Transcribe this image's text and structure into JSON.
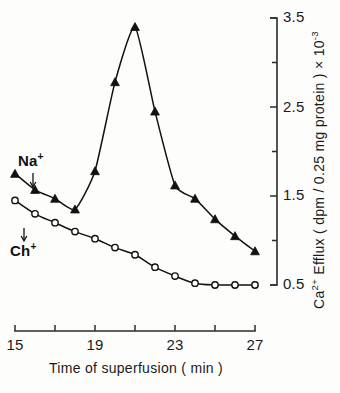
{
  "chart_data": {
    "type": "line",
    "title": "",
    "xlabel": "Time of superfusion  ( min )",
    "ylabel": "Ca2+  Efflux  ( dpm / 0.25 mg protein ) x 10-3",
    "ylabel_parts": {
      "prefix": "Ca",
      "prefix_sup": "2+",
      "middle": " Efflux  ( dpm / 0.25 mg protein ) × 10",
      "suffix_sup": "-3"
    },
    "xlim": [
      15,
      27
    ],
    "ylim": [
      0.5,
      3.5
    ],
    "x_major_ticks": [
      15,
      19,
      23,
      27
    ],
    "x_all_ticks": [
      15,
      17,
      19,
      21,
      23,
      25,
      27
    ],
    "x_tick_labels": [
      "15",
      "19",
      "23",
      "27"
    ],
    "y_major_ticks": [
      0.5,
      1.5,
      2.5,
      3.5
    ],
    "y_all_ticks": [
      0.5,
      1.0,
      1.5,
      2.0,
      2.5,
      3.0,
      3.5
    ],
    "y_tick_labels": [
      "3.5",
      "2.5",
      "1.5",
      "0.5"
    ],
    "y_axis_position": "right",
    "grid": false,
    "legend": "inline-annotations",
    "series": [
      {
        "name": "Na+",
        "label_text": "Na",
        "label_sup": "+",
        "marker": "filled-triangle",
        "color": "#111111",
        "x": [
          15,
          16,
          17,
          18,
          19,
          20,
          21,
          22,
          23,
          24,
          25,
          26,
          27
        ],
        "values": [
          1.75,
          1.57,
          1.47,
          1.35,
          1.78,
          2.78,
          3.4,
          2.45,
          1.62,
          1.47,
          1.24,
          1.05,
          0.88
        ]
      },
      {
        "name": "Ch+",
        "label_text": "Ch",
        "label_sup": "+",
        "marker": "open-circle",
        "color": "#111111",
        "x": [
          15,
          16,
          17,
          18,
          19,
          20,
          21,
          22,
          23,
          24,
          25,
          26,
          27
        ],
        "values": [
          1.45,
          1.3,
          1.2,
          1.1,
          1.02,
          0.92,
          0.84,
          0.7,
          0.6,
          0.52,
          0.5,
          0.5,
          0.5
        ]
      }
    ],
    "annotations": [
      {
        "text": "Na",
        "sup": "+",
        "series": "Na+",
        "arrow": "down"
      },
      {
        "text": "Ch",
        "sup": "+",
        "series": "Ch+",
        "arrow": "down"
      }
    ]
  }
}
